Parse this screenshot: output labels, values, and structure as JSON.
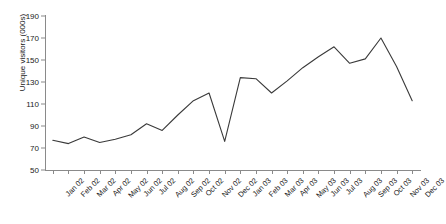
{
  "chart_data": {
    "type": "line",
    "title": "",
    "xlabel": "",
    "ylabel": "Unique visitors (000s)",
    "ylim": [
      50,
      190
    ],
    "ytick_labels": [
      "50",
      "70",
      "90",
      "110",
      "130",
      "150",
      "170",
      "190"
    ],
    "ytick_values": [
      50,
      70,
      90,
      110,
      130,
      150,
      170,
      190
    ],
    "grid": false,
    "legend": "none",
    "categories": [
      "Jan 02",
      "Feb 02",
      "Mar 02",
      "Apr 02",
      "May 02",
      "Jun 02",
      "Jul 02",
      "Aug 02",
      "Sep 02",
      "Oct 02",
      "Nov 02",
      "Dec 02",
      "Jan 03",
      "Feb 03",
      "Mar 03",
      "Apr 03",
      "May 03",
      "Jun 03",
      "Jul 03",
      "Aug 03",
      "Sep 03",
      "Oct 03",
      "Nov 03",
      "Dec 03"
    ],
    "values": [
      77,
      74,
      80,
      75,
      78,
      82,
      92,
      86,
      100,
      113,
      120,
      76,
      134,
      133,
      120,
      131,
      143,
      153,
      162,
      147,
      151,
      170,
      144,
      113
    ],
    "series": [
      {
        "name": "Unique visitors",
        "color": "#3a3a3a",
        "values": [
          77,
          74,
          80,
          75,
          78,
          82,
          92,
          86,
          100,
          113,
          120,
          76,
          134,
          133,
          120,
          131,
          143,
          153,
          162,
          147,
          151,
          170,
          144,
          113
        ]
      }
    ],
    "axis_color": "#8a8a8a"
  }
}
